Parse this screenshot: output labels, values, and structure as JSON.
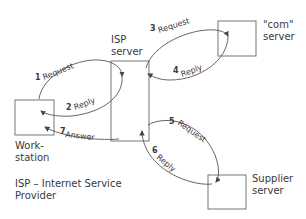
{
  "nodes": {
    "workstation": {
      "label_line1": "Work-",
      "label_line2": "station"
    },
    "isp_server": {
      "label_line1": "ISP",
      "label_line2": "server"
    },
    "com_server": {
      "label_line1": "\"com\"",
      "label_line2": "server"
    },
    "supplier_server": {
      "label_line1": "Supplier",
      "label_line2": "server"
    }
  },
  "arrows": [
    {
      "num": "1",
      "label": "Request"
    },
    {
      "num": "2",
      "label": "Reply"
    },
    {
      "num": "3",
      "label": "Request"
    },
    {
      "num": "4",
      "label": "Reply"
    },
    {
      "num": "5",
      "label": "Request"
    },
    {
      "num": "6",
      "label": "Reply"
    },
    {
      "num": "7",
      "label": "Answer"
    }
  ],
  "legend": {
    "line1": "ISP – Internet Service",
    "line2": "Provider"
  },
  "colors": {
    "stroke": "#555555",
    "text": "#3a3a3a"
  }
}
